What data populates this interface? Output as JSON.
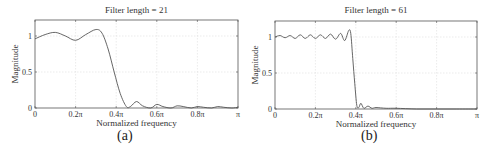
{
  "chart_data": [
    {
      "type": "line",
      "panel_label": "(a)",
      "title": "Filter length = 21",
      "xlabel": "Normalized frequency",
      "ylabel": "Magnitude",
      "xticks": [
        "0",
        "0.2π",
        "0.4π",
        "0.6π",
        "0.8π",
        "π"
      ],
      "yticks": [
        "0",
        "0.5",
        "1"
      ],
      "xlim": [
        0,
        1
      ],
      "ylim": [
        0,
        1.22
      ],
      "grid": true,
      "series": [
        {
          "name": "Magnitude response",
          "x": [
            0,
            0.05,
            0.1,
            0.15,
            0.2,
            0.25,
            0.3,
            0.33,
            0.36,
            0.39,
            0.42,
            0.45,
            0.47,
            0.5,
            0.53,
            0.57,
            0.6,
            0.63,
            0.67,
            0.7,
            0.73,
            0.77,
            0.8,
            0.83,
            0.87,
            0.9,
            0.93,
            0.97,
            1.0
          ],
          "values": [
            0.96,
            1.02,
            1.05,
            1.0,
            0.94,
            1.02,
            1.09,
            1.04,
            0.82,
            0.5,
            0.2,
            0.02,
            0.02,
            0.09,
            0.03,
            0.0,
            0.05,
            0.02,
            0.0,
            0.03,
            0.02,
            0.0,
            0.02,
            0.01,
            0.0,
            0.02,
            0.01,
            0.0,
            0.01
          ]
        }
      ]
    },
    {
      "type": "line",
      "panel_label": "(b)",
      "title": "Filter length = 61",
      "xlabel": "Normalized frequency",
      "ylabel": "Magnitude",
      "xticks": [
        "0",
        "0.2π",
        "0.4π",
        "0.6π",
        "0.8π",
        "π"
      ],
      "yticks": [
        "0",
        "0.5",
        "1"
      ],
      "xlim": [
        0,
        1
      ],
      "ylim": [
        0,
        1.22
      ],
      "grid": true,
      "series": [
        {
          "name": "Magnitude response",
          "x": [
            0,
            0.025,
            0.05,
            0.075,
            0.1,
            0.125,
            0.15,
            0.175,
            0.2,
            0.225,
            0.25,
            0.275,
            0.3,
            0.325,
            0.345,
            0.365,
            0.375,
            0.385,
            0.395,
            0.405,
            0.415,
            0.425,
            0.44,
            0.46,
            0.48,
            0.5,
            0.55,
            0.6,
            0.7,
            0.8,
            0.9,
            1.0
          ],
          "values": [
            1.0,
            1.02,
            0.99,
            1.02,
            0.98,
            1.03,
            0.98,
            1.03,
            0.98,
            1.03,
            0.98,
            1.04,
            0.97,
            1.05,
            0.95,
            1.09,
            1.05,
            0.7,
            0.35,
            0.05,
            0.02,
            0.08,
            0.01,
            0.04,
            0.01,
            0.02,
            0.01,
            0.01,
            0.0,
            0.0,
            0.0,
            0.0
          ]
        }
      ]
    }
  ],
  "panels": [
    {
      "title": "Filter length = 21",
      "xlabel": "Normalized frequency",
      "ylabel": "Magnitude",
      "caption": "(a)"
    },
    {
      "title": "Filter length = 61",
      "xlabel": "Normalized frequency",
      "ylabel": "Magnitude",
      "caption": "(b)"
    }
  ],
  "colors": {
    "line": "#555555",
    "grid": "#dddddd",
    "axis": "#555555"
  }
}
